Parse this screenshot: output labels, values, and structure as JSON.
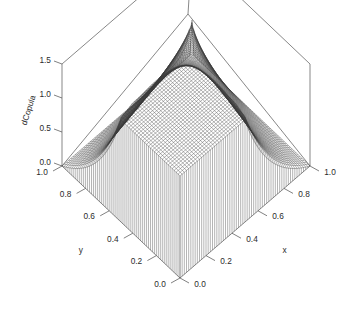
{
  "figure": {
    "kind": "3d-surface-wireframe",
    "background_color": "#ffffff",
    "mesh_color": "#3a3a3a",
    "frame_color": "#555555",
    "text_color": "#2b2b2b"
  },
  "axes": {
    "x": {
      "title": "x",
      "ticks": [
        "0.0",
        "0.2",
        "0.4",
        "0.6",
        "0.8",
        "1.0"
      ],
      "range": [
        0,
        1
      ]
    },
    "y": {
      "title": "y",
      "ticks": [
        "0.0",
        "0.2",
        "0.4",
        "0.6",
        "0.8",
        "1.0"
      ],
      "range": [
        0,
        1
      ]
    },
    "z": {
      "title": "dCopula",
      "ticks": [
        "0.0",
        "0.5",
        "1.0",
        "1.5"
      ],
      "range": [
        0,
        1.5
      ]
    }
  },
  "chart_data": {
    "type": "surface",
    "title": "",
    "xlabel": "x",
    "ylabel": "y",
    "zlabel": "dCopula",
    "xlim": [
      0,
      1
    ],
    "ylim": [
      0,
      1
    ],
    "zlim": [
      0,
      1.5
    ],
    "xticks": [
      0.0,
      0.2,
      0.4,
      0.6,
      0.8,
      1.0
    ],
    "yticks": [
      0.0,
      0.2,
      0.4,
      0.6,
      0.8,
      1.0
    ],
    "zticks": [
      0.0,
      0.5,
      1.0,
      1.5
    ],
    "grid": false,
    "legend": "none",
    "surface": {
      "function": "gumbel-copula-density",
      "theta": 2,
      "grid_n": 60,
      "description": "Symmetric bivariate copula density: tall spikes at the (1,1) back corner and the (0,0) front corner, low ridges along the u=0 and v=0 edges, minimum near the mid-sides; z clipped at 1.5 so the peaks exit through the top of the box.",
      "notable_values": [
        {
          "x": 0.0,
          "y": 0.0,
          "z": 1.5
        },
        {
          "x": 1.0,
          "y": 1.0,
          "z": 1.5
        },
        {
          "x": 0.5,
          "y": 0.5,
          "z": 0.55
        },
        {
          "x": 1.0,
          "y": 0.0,
          "z": 0.0
        },
        {
          "x": 0.0,
          "y": 1.0,
          "z": 0.0
        },
        {
          "x": 0.5,
          "y": 0.0,
          "z": 0.1
        },
        {
          "x": 0.0,
          "y": 0.5,
          "z": 0.1
        }
      ]
    },
    "projection": {
      "type": "parallel-3d",
      "corner_back": [
        188,
        14
      ],
      "corner_left": [
        62,
        166
      ],
      "corner_right": [
        310,
        166
      ],
      "corner_front": [
        180,
        278
      ],
      "z_height_px": 102
    }
  }
}
